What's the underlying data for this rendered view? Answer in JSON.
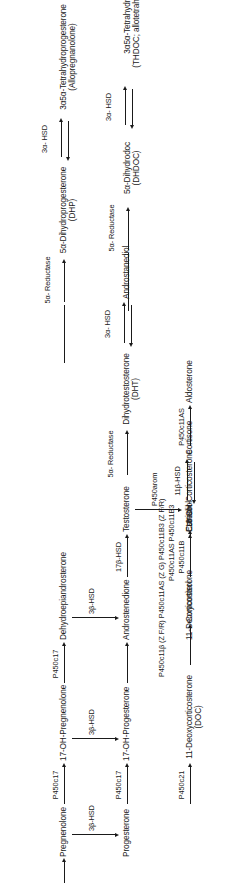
{
  "figure": {
    "kind": "steroidogenesis-pathway-diagram",
    "orientation": "rotated-90-ccw",
    "ink_color": "#1a1a1a",
    "background": "#ffffff"
  },
  "nodes": {
    "pregnenolone": {
      "line1": "Pregnenolone",
      "line2": ""
    },
    "oh_pregnenolone": {
      "line1": "17-OH-Pregnenolone",
      "line2": ""
    },
    "dhea": {
      "line1": "Dehydroepiandrosterone",
      "line2": ""
    },
    "progesterone": {
      "line1": "Progesterone",
      "line2": ""
    },
    "oh_progesterone": {
      "line1": "17-OH-Progesterone",
      "line2": ""
    },
    "androstenedione": {
      "line1": "Androstenedione",
      "line2": ""
    },
    "testosterone": {
      "line1": "Testosterone",
      "line2": ""
    },
    "estradiol": {
      "line1": "Estradiol",
      "line2": ""
    },
    "dht": {
      "line1": "Dihydrotestosterone",
      "line2": "(DHT)"
    },
    "androstanediol": {
      "line1": "Androstanediol",
      "line2": ""
    },
    "deoxycortisol": {
      "line1": "11-Deoxycortisol",
      "line2": ""
    },
    "cortisol": {
      "line1": "Cortisol",
      "line2": ""
    },
    "cortisone": {
      "line1": "Cortisone",
      "line2": ""
    },
    "doc": {
      "line1": "11-Deoxycorticosterone",
      "line2": "(DOC)"
    },
    "corticosterone": {
      "line1": "Corticosterone",
      "line2": ""
    },
    "oh_corticosterone": {
      "line1": "18-OH-Corticosterone",
      "line2": ""
    },
    "aldosterone": {
      "line1": "Aldosterone",
      "line2": ""
    },
    "dhp": {
      "line1": "5α-Dihydroprogesterone",
      "line2": "(DHP)"
    },
    "dhdoc": {
      "line1": "5α-Dihydrodoc",
      "line2": "(DHDOC)"
    },
    "allopregnanolone": {
      "line1": "3α5α-Tetrahydroprogesterone",
      "line2": "(Allopregnanolone)"
    },
    "thdoc": {
      "line1": "3α5α-Tetrahydrodoc",
      "line2": "(THDOC; allotetrahydrodoc)"
    }
  },
  "enzymes": {
    "p450c17_a": {
      "line1": "P450c17",
      "line2": ""
    },
    "p450c17_b": {
      "line1": "P450c17",
      "line2": ""
    },
    "p450c17_c": {
      "line1": "P450c17",
      "line2": ""
    },
    "p450c17_d": {
      "line1": "P450c17",
      "line2": ""
    },
    "hsd3b_a": {
      "line1": "3β-HSD",
      "line2": ""
    },
    "hsd3b_b": {
      "line1": "3β-HSD",
      "line2": ""
    },
    "hsd3b_c": {
      "line1": "3β-HSD",
      "line2": ""
    },
    "hsd17b": {
      "line1": "17β-HSD",
      "line2": ""
    },
    "p450arom": {
      "line1": "P450arom",
      "line2": ""
    },
    "reductase5a_t": {
      "line1": "5α-",
      "line2": "Reductase"
    },
    "hsd3a_top": {
      "line1": "3α-",
      "line2": "HSD"
    },
    "p450c21_a": {
      "line1": "P450c21",
      "line2": ""
    },
    "p450c11b": {
      "line1": "P450c11B",
      "line2": ""
    },
    "hsd11b": {
      "line1": "11β-HSD",
      "line2": ""
    },
    "doc_enzymes": {
      "line1": "P450c11β (Z F/R)",
      "line2": "P450c11AS (Z G)",
      "line3": "P450c11B3 (Z F/R)"
    },
    "cort_enzymes": {
      "line1": "P450c11AS",
      "line2": "P450c11B3"
    },
    "p450c11as": {
      "line1": "P450c11AS",
      "line2": ""
    },
    "reductase5a_p": {
      "line1": "5α-",
      "line2": "Reductase"
    },
    "reductase5a_d": {
      "line1": "5α-",
      "line2": "Reductase"
    },
    "hsd3a_p": {
      "line1": "3α-",
      "line2": "HSD"
    },
    "hsd3a_d": {
      "line1": "3α-",
      "line2": "HSD"
    }
  }
}
